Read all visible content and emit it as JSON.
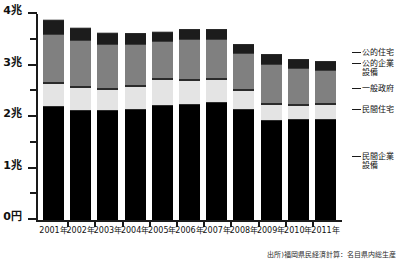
{
  "axis": {
    "y_labels": [
      "4兆",
      "3兆",
      "2兆",
      "1兆",
      "0円"
    ],
    "y_values": [
      4,
      3,
      2,
      1,
      0
    ],
    "y_minor_values": [
      3.5,
      2.5,
      1.5,
      0.5
    ]
  },
  "legend": {
    "koteki_jutaku": "公的住宅",
    "koteki_kigyo_l1": "公的企業",
    "koteki_kigyo_l2": "設備",
    "ippan_seifu": "一般政府",
    "minkan_jutaku": "民間住宅",
    "minkan_kigyo_l1": "民間企業",
    "minkan_kigyo_l2": "設備"
  },
  "source": "出所)福岡県民経済計算：名目県内総生産",
  "chart_data": {
    "type": "bar",
    "title": "",
    "xlabel": "",
    "ylabel": "",
    "stacked": true,
    "unit": "兆円",
    "ylim": [
      0,
      4
    ],
    "yticks": [
      0,
      0.5,
      1,
      1.5,
      2,
      2.5,
      3,
      3.5,
      4
    ],
    "ytick_labels": [
      "0円",
      "",
      "1兆",
      "",
      "2兆",
      "",
      "3兆",
      "",
      "4兆"
    ],
    "grid": false,
    "legend_position": "right",
    "categories": [
      "2001年",
      "2002年",
      "2003年",
      "2004年",
      "2005年",
      "2006年",
      "2007年",
      "2008年",
      "2009年",
      "2010年",
      "2011年"
    ],
    "series": [
      {
        "name": "民間企業設備",
        "color": "#000000",
        "values": [
          2.19,
          2.11,
          2.12,
          2.13,
          2.22,
          2.24,
          2.27,
          2.14,
          1.93,
          1.95,
          1.95
        ]
      },
      {
        "name": "民間住宅",
        "color": "#e4e4e4",
        "values": [
          0.47,
          0.47,
          0.43,
          0.47,
          0.51,
          0.48,
          0.46,
          0.38,
          0.33,
          0.29,
          0.31
        ]
      },
      {
        "name": "一般政府",
        "color": "#808080",
        "values": [
          0.93,
          0.89,
          0.85,
          0.79,
          0.73,
          0.78,
          0.77,
          0.7,
          0.75,
          0.69,
          0.63
        ]
      },
      {
        "name": "公的企業設備",
        "color": "#1c1c1c",
        "values": [
          0.27,
          0.24,
          0.22,
          0.22,
          0.18,
          0.19,
          0.19,
          0.18,
          0.19,
          0.18,
          0.17
        ]
      },
      {
        "name": "公的住宅",
        "color": "#bdbdbd",
        "values": [
          0.04,
          0.03,
          0.03,
          0.03,
          0.03,
          0.02,
          0.02,
          0.02,
          0.02,
          0.02,
          0.02
        ]
      }
    ],
    "totals": [
      3.9,
      3.74,
      3.65,
      3.64,
      3.67,
      3.71,
      3.71,
      3.42,
      3.22,
      3.13,
      3.08
    ]
  }
}
